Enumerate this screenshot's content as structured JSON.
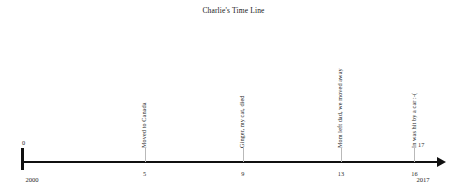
{
  "chart_data": {
    "type": "timeline",
    "title": "Charlie's Time Line",
    "xlabel": "",
    "ylabel": "",
    "axis": {
      "start_value": 0,
      "end_value": 17,
      "start_year": "2000",
      "end_year": "2017",
      "start_label": "0",
      "end_label": "17",
      "grid": false,
      "arrow_direction": "right"
    },
    "ticks": [
      {
        "label": "5",
        "value": 5
      },
      {
        "label": "9",
        "value": 9
      },
      {
        "label": "13",
        "value": 13
      },
      {
        "label": "16",
        "value": 16
      }
    ],
    "events": [
      {
        "label": "Moved to Canada",
        "value": 5
      },
      {
        "label": "Ginger, my cat, died",
        "value": 9
      },
      {
        "label": "Mom left dad, we moved away",
        "value": 13
      },
      {
        "label": "In was hit by a car :-(",
        "value": 16
      }
    ],
    "colors": {
      "axis": "#101010",
      "tick": "#b9b9b9",
      "text": "#1c1c1c",
      "background": "#ffffff"
    }
  }
}
